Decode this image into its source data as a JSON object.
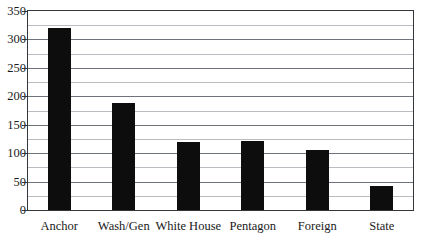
{
  "chart_data": {
    "type": "bar",
    "title": "",
    "subtitle": "",
    "xlabel": "",
    "ylabel": "",
    "categories": [
      "Anchor",
      "Wash/Gen",
      "White House",
      "Pentagon",
      "Foreign",
      "State"
    ],
    "values": [
      320,
      188,
      120,
      121,
      106,
      42
    ],
    "series": [
      {
        "name": "Count",
        "values": [
          320,
          188,
          120,
          121,
          106,
          42
        ]
      }
    ],
    "ylim": [
      0,
      350
    ],
    "ytick_step": 50,
    "yticks": [
      0,
      50,
      100,
      150,
      200,
      250,
      300,
      350
    ],
    "ytick_labels": [
      "0",
      "50",
      "100",
      "150",
      "200",
      "250",
      "300",
      "350"
    ],
    "minor_gridline_step": 25,
    "minor_gridlines": [
      25,
      75,
      125,
      175,
      225,
      275,
      325
    ],
    "grid": true,
    "legend": false,
    "legend_position": "none",
    "bar_color": "#0d0d0d",
    "gridline_color": "#6e737a",
    "minor_gridline_color": "#b9bdc2",
    "frame_color": "#33373c",
    "background_color": "#ffffff",
    "text_color": "#1a1a1a",
    "annotations": []
  },
  "layout": {
    "plot_left": 27,
    "plot_top": 10,
    "plot_width": 387,
    "plot_height": 201,
    "bar_width": 23,
    "label_baseline_y": 220
  }
}
